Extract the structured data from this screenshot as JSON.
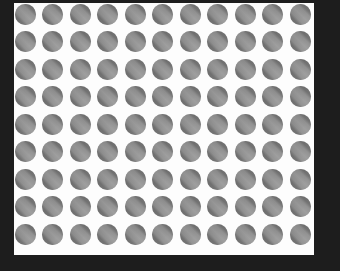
{
  "canvas": {
    "width": 340,
    "height": 271,
    "background_color": "#ffffff"
  },
  "frame": {
    "name": "outer-dark-frame",
    "color": "#1d1d1d",
    "border_left_px": 14,
    "border_top_px": 3,
    "border_right_px": 26,
    "border_bottom_px": 16
  },
  "panel": {
    "name": "white-panel",
    "color": "#fdfdfd",
    "x": 14,
    "y": 3,
    "width": 300,
    "height": 252
  },
  "chart_data": {
    "type": "scatter",
    "title": "",
    "subtitle": "",
    "xlabel": "",
    "ylabel": "",
    "grid": false,
    "legend_position": "none",
    "columns": 11,
    "rows": 9,
    "total_points": 99,
    "x": [
      1,
      2,
      3,
      4,
      5,
      6,
      7,
      8,
      9,
      10,
      11
    ],
    "y": [
      1,
      2,
      3,
      4,
      5,
      6,
      7,
      8,
      9
    ],
    "xlim": [
      0.5,
      11.5
    ],
    "ylim": [
      0.5,
      9.5
    ],
    "tick_labels_x": [],
    "tick_labels_y": [],
    "annotations": []
  },
  "dots": {
    "name": "dot",
    "count": 99,
    "diameter_px": 21,
    "spacing_x_px": 27.5,
    "spacing_y_px": 27.5,
    "offset_x_px": 11,
    "offset_y_px": 11,
    "fill_color": "#757575",
    "highlight_color": "#bdbdbd",
    "highlight_angle_deg": 45,
    "shape": "circle"
  }
}
